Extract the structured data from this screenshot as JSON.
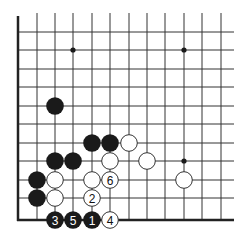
{
  "diagram": {
    "type": "go-board-corner",
    "grid": {
      "columns_x": [
        18,
        37,
        55,
        73,
        92,
        110,
        129,
        147,
        165,
        184,
        202,
        221
      ],
      "rows_y": [
        32,
        50,
        69,
        87,
        106,
        124,
        143,
        161,
        180,
        198,
        220
      ],
      "top_fade_y": 13,
      "right_extent_x": 234,
      "left_border": true,
      "bottom_border": true
    },
    "colors": {
      "line": "#333333",
      "border": "#222222",
      "black_stone": "#1a1a1a",
      "white_stone": "#ffffff",
      "white_outline": "#333333"
    },
    "star_points": [
      {
        "x": 73,
        "y": 50
      },
      {
        "x": 184,
        "y": 50
      },
      {
        "x": 184,
        "y": 161
      }
    ],
    "stones": [
      {
        "color": "black",
        "x": 55,
        "y": 106,
        "label": ""
      },
      {
        "color": "black",
        "x": 92,
        "y": 143,
        "label": ""
      },
      {
        "color": "black",
        "x": 110,
        "y": 143,
        "label": ""
      },
      {
        "color": "white",
        "x": 129,
        "y": 143,
        "label": ""
      },
      {
        "color": "black",
        "x": 55,
        "y": 161,
        "label": ""
      },
      {
        "color": "black",
        "x": 73,
        "y": 161,
        "label": ""
      },
      {
        "color": "white",
        "x": 110,
        "y": 161,
        "label": ""
      },
      {
        "color": "white",
        "x": 147,
        "y": 161,
        "label": ""
      },
      {
        "color": "black",
        "x": 37,
        "y": 180,
        "label": ""
      },
      {
        "color": "white",
        "x": 55,
        "y": 180,
        "label": ""
      },
      {
        "color": "white",
        "x": 92,
        "y": 180,
        "label": ""
      },
      {
        "color": "white",
        "x": 110,
        "y": 180,
        "label": "6"
      },
      {
        "color": "white",
        "x": 184,
        "y": 180,
        "label": ""
      },
      {
        "color": "black",
        "x": 37,
        "y": 198,
        "label": ""
      },
      {
        "color": "white",
        "x": 55,
        "y": 198,
        "label": ""
      },
      {
        "color": "white",
        "x": 92,
        "y": 198,
        "label": "2"
      },
      {
        "color": "black",
        "x": 55,
        "y": 220,
        "label": "3"
      },
      {
        "color": "black",
        "x": 73,
        "y": 220,
        "label": "5"
      },
      {
        "color": "black",
        "x": 92,
        "y": 220,
        "label": "1"
      },
      {
        "color": "white",
        "x": 110,
        "y": 220,
        "label": "4"
      }
    ],
    "move_labels": [
      "1",
      "2",
      "3",
      "4",
      "5",
      "6"
    ]
  }
}
